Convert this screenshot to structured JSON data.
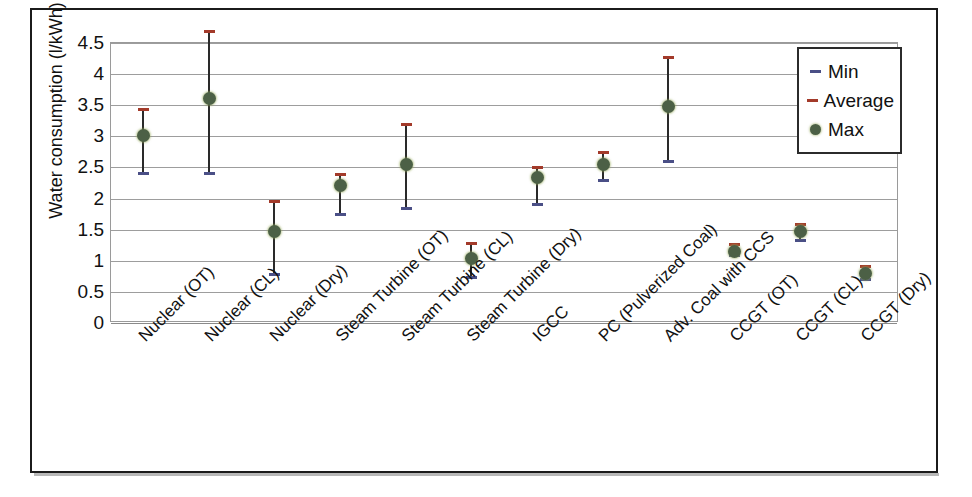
{
  "chart_data": {
    "type": "scatter",
    "title": "",
    "xlabel": "",
    "ylabel": "Water consumption (l/kWh)",
    "ylim": [
      0,
      4.5
    ],
    "ytick_labels": [
      "4.5",
      "4",
      "3.5",
      "3",
      "2.5",
      "2",
      "1.5",
      "1",
      "0.5",
      "0"
    ],
    "ytick_values": [
      4.5,
      4,
      3.5,
      3,
      2.5,
      2,
      1.5,
      1,
      0.5,
      0
    ],
    "grid": true,
    "legend_position": "top-right",
    "categories": [
      "Nuclear (OT)",
      "Nuclear (CL)",
      "Nuclear (Dry)",
      "Steam Turbine (OT)",
      "Steam Turbine (CL)",
      "Steam Turbine (Dry)",
      "IGCC",
      "PC (Pulverized Coal)",
      "Adv. Coal with CCS",
      "CCGT (OT)",
      "CCGT (CL)",
      "CCGT (Dry)"
    ],
    "series": [
      {
        "name": "Min",
        "marker": "dash",
        "color": "#4a4f86",
        "values": [
          1.72,
          1.72,
          0.1,
          1.06,
          1.15,
          0.05,
          1.22,
          1.6,
          1.92,
          0.4,
          0.64,
          0.02
        ]
      },
      {
        "name": "Average",
        "marker": "dash",
        "color": "#a33a2a",
        "values": [
          2.75,
          4.0,
          1.27,
          1.7,
          2.5,
          0.6,
          1.82,
          2.05,
          3.58,
          0.58,
          0.9,
          0.22
        ]
      },
      {
        "name": "Max",
        "marker": "dot",
        "color": "#4c6046",
        "values": [
          2.33,
          2.92,
          0.78,
          1.52,
          1.87,
          0.36,
          1.66,
          1.87,
          2.79,
          0.47,
          0.79,
          0.11
        ]
      }
    ]
  },
  "legend": {
    "items": [
      {
        "label": "Min",
        "swatch": "dash-marker-blue"
      },
      {
        "label": "Average",
        "swatch": "dash-marker-red"
      },
      {
        "label": "Max",
        "swatch": "dot-marker-green"
      }
    ]
  }
}
